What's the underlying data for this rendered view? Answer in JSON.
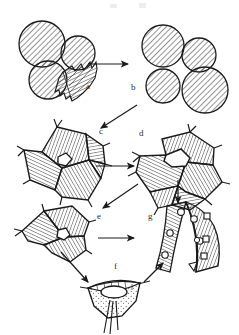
{
  "figure": {
    "title": "",
    "domain_note": "schematic morphogenetic sequence",
    "background_color": "#ffffff",
    "ink_color": "#1a1a1a",
    "hatch_color": "#3a3a3a"
  },
  "panels": [
    {
      "id": "a",
      "label": "a",
      "label_x": 86,
      "label_y": 86,
      "caption": "cluster of three hatched round cells with adjacent serrated crest"
    },
    {
      "id": "b",
      "label": "b",
      "label_x": 131,
      "label_y": 87,
      "caption": "compact cluster of four hatched round cells"
    },
    {
      "id": "c",
      "label": "c",
      "label_x": 99,
      "label_y": 131,
      "caption": "polygonal cells packed with small central cavity"
    },
    {
      "id": "d",
      "label": "d",
      "label_x": 139,
      "label_y": 133,
      "caption": "enlarged central lumen surrounded by wedge shaped cells"
    },
    {
      "id": "e",
      "label": "e",
      "label_x": 97,
      "label_y": 216,
      "caption": "fan shaped group of cells with small apical cavity"
    },
    {
      "id": "f",
      "label": "f",
      "label_x": 114,
      "label_y": 266,
      "caption": "cup shaped stippled vesicle with central pore and trailing filaments"
    },
    {
      "id": "g",
      "label": "g",
      "label_x": 148,
      "label_y": 216,
      "caption": "two curved hatched bands bearing small circular and square inclusions"
    }
  ],
  "arrows": [
    {
      "name": "arrow-a-to-b",
      "from": "a",
      "to": "b",
      "kind": "horizontal-right"
    },
    {
      "name": "arrow-b-to-c",
      "from": "b",
      "to": "c",
      "kind": "diagonal-down-left"
    },
    {
      "name": "arrow-c-to-d",
      "from": "c",
      "to": "d",
      "kind": "horizontal-right"
    },
    {
      "name": "arrow-d-to-e",
      "from": "d",
      "to": "e",
      "kind": "diagonal-down-left"
    },
    {
      "name": "arrow-d-to-g",
      "from": "d",
      "to": "g",
      "kind": "vertical-down"
    },
    {
      "name": "arrow-e-to-g",
      "from": "e",
      "to": "g",
      "kind": "horizontal-right"
    },
    {
      "name": "arrow-e-to-f",
      "from": "e",
      "to": "f",
      "kind": "diagonal-down-right"
    },
    {
      "name": "arrow-f-to-g",
      "from": "f",
      "to": "g",
      "kind": "diagonal-up-right"
    }
  ]
}
